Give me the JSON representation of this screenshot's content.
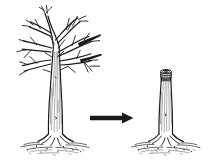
{
  "figure": {
    "background_color": "#ffffff",
    "ink_color": "#1a1a1a",
    "width_px": 210,
    "height_px": 166,
    "caption": "",
    "panels": [
      {
        "id": "before",
        "label": "",
        "subject": "bare-deciduous-tree",
        "description": "Mature bare deciduous tree with full branch crown, trunk and surface roots in leaf litter"
      },
      {
        "id": "transform",
        "label": "",
        "subject": "right-arrow",
        "description": "Solid black arrow pointing right indicating the change"
      },
      {
        "id": "after",
        "label": "",
        "subject": "topped-tree-stump",
        "description": "Same tree after topping: all branches removed leaving a tall cut stump with exposed cut face showing growth rings"
      }
    ],
    "arrow": {
      "direction": "right",
      "color": "#1a1a1a",
      "x_start": 90,
      "x_end": 133,
      "y": 118
    }
  }
}
